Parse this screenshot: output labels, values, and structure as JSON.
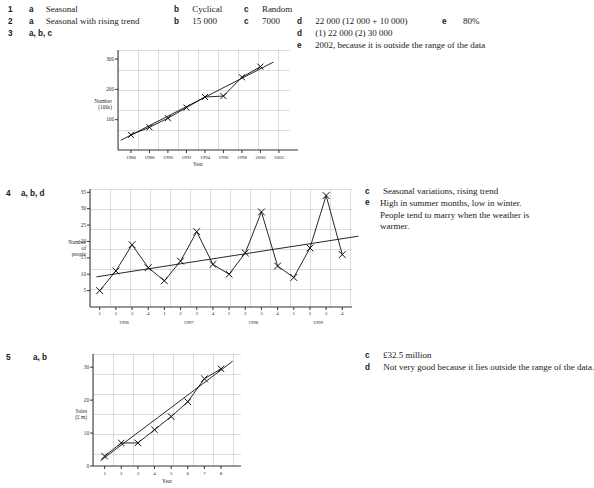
{
  "answers": {
    "q1": {
      "num": "1",
      "parts": [
        {
          "label": "a",
          "text": "Seasonal"
        },
        {
          "label": "b",
          "text": "Cyclical"
        },
        {
          "label": "c",
          "text": "Random"
        }
      ]
    },
    "q2": {
      "num": "2",
      "parts": [
        {
          "label": "a",
          "text": "Seasonal with rising trend"
        },
        {
          "label": "b",
          "text": "15 000"
        },
        {
          "label": "c",
          "text": "7000"
        },
        {
          "label": "d",
          "text": "22 000 (12 000 + 10 000)"
        },
        {
          "label": "e",
          "text": "80%"
        }
      ]
    },
    "q3": {
      "num": "3",
      "parts_inline": "a, b, c",
      "parts": [
        {
          "label": "d",
          "text": "(1)  22 000          (2)  30 000"
        },
        {
          "label": "e",
          "text": "2002, because it is outside the range of the data"
        }
      ]
    },
    "q4": {
      "num": "4",
      "parts_inline": "a, b, d",
      "parts": [
        {
          "label": "c",
          "text": "Seasonal variations, rising trend"
        },
        {
          "label": "e",
          "text": "High in summer months, low in winter. People tend to marry when the weather is warmer."
        }
      ]
    },
    "q5": {
      "num": "5",
      "parts_inline": "a, b",
      "parts": [
        {
          "label": "c",
          "text": "£32.5 million"
        },
        {
          "label": "d",
          "text": "Not very good because it lies outside the range of the data."
        }
      ]
    }
  },
  "chart_data": [
    {
      "id": "chart-q3",
      "type": "line",
      "title": "",
      "xlabel": "Year",
      "ylabel": "Number (100s)",
      "ylabel_lines": [
        "Number",
        "(100s)"
      ],
      "x": [
        1986,
        1988,
        1990,
        1992,
        1994,
        1996,
        1998,
        2000
      ],
      "xticks": [
        1986,
        1988,
        1990,
        1992,
        1994,
        1996,
        1998,
        2000,
        2002
      ],
      "xlim": [
        1984.6,
        2003.2
      ],
      "yticks": [
        100,
        200,
        300
      ],
      "ylim": [
        0,
        330
      ],
      "grid": true,
      "markers": "cross",
      "series": [
        {
          "name": "Data",
          "values": [
            50,
            75,
            105,
            140,
            175,
            178,
            240,
            275
          ]
        }
      ],
      "trend": {
        "name": "Trend line",
        "x": [
          1984.9,
          2001.4
        ],
        "y": [
          32,
          290
        ]
      }
    },
    {
      "id": "chart-q4",
      "type": "line",
      "title": "",
      "xlabel": "",
      "ylabel": "Number of people",
      "ylabel_lines": [
        "Number",
        "of",
        "people"
      ],
      "xticks": [
        "1",
        "2",
        "3",
        "4",
        "1",
        "2",
        "3",
        "4",
        "1",
        "2",
        "3",
        "4",
        "1",
        "2",
        "3",
        "4"
      ],
      "group_labels": [
        "1996",
        "1997",
        "1998",
        "1999"
      ],
      "yticks": [
        5,
        10,
        15,
        20,
        25,
        30,
        35
      ],
      "ylim": [
        0,
        36
      ],
      "grid": true,
      "markers": "cross",
      "series": [
        {
          "name": "Number of people",
          "values": [
            5,
            11,
            19,
            12,
            8,
            14,
            23,
            13,
            10,
            16.5,
            29,
            12.5,
            9,
            18,
            34,
            16
          ]
        }
      ],
      "trend": {
        "name": "Trend line",
        "x": [
          0.4,
          16.6
        ],
        "y": [
          9.2,
          21.6
        ]
      }
    },
    {
      "id": "chart-q5",
      "type": "line",
      "title": "",
      "xlabel": "Year",
      "ylabel": "Sales (£ m)",
      "ylabel_lines": [
        "Sales",
        "(£ m)"
      ],
      "x": [
        1,
        2,
        3,
        4,
        5,
        6,
        7,
        8
      ],
      "xticks": [
        1,
        2,
        3,
        4,
        5,
        6,
        7,
        8
      ],
      "xlim": [
        0.3,
        9.2
      ],
      "yticks": [
        0,
        10,
        20,
        30
      ],
      "ylim": [
        0,
        34
      ],
      "grid": true,
      "markers": "cross",
      "series": [
        {
          "name": "Sales",
          "values": [
            3,
            7,
            7,
            11,
            15,
            19.5,
            26.5,
            29.5
          ]
        }
      ],
      "trend": {
        "name": "Trend line",
        "x": [
          0.75,
          8.7
        ],
        "y": [
          1.6,
          31.8
        ]
      }
    }
  ]
}
